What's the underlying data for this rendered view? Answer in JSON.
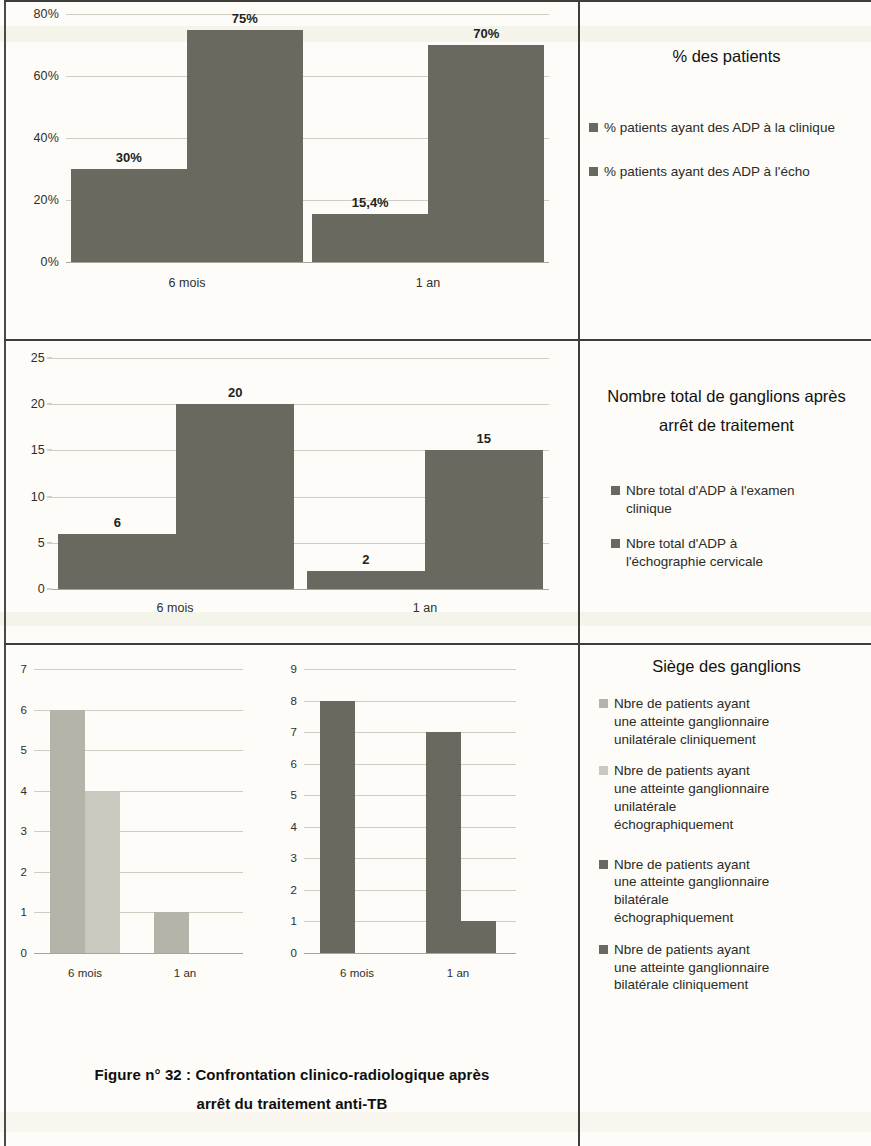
{
  "colors": {
    "bar_dark": "#6a6960",
    "bar_mid": "#a9a89c",
    "bar_light": "#c9c8be",
    "grid": "#cfcdc2",
    "divider": "#3d3d39",
    "text": "#1b1b1b"
  },
  "caption": {
    "text": "Figure n°  32 : Confrontation clinico-radiologique après",
    "text2": "arrêt du traitement anti-TB"
  },
  "panels": [
    {
      "title": "% des patients",
      "legend": [
        {
          "label": "% patients ayant des ADP à la clinique",
          "color": "#6a6960"
        },
        {
          "label": "% patients ayant des ADP à l'écho",
          "color": "#6a6960"
        }
      ]
    },
    {
      "title_line1": "Nombre total de ganglions après",
      "title_line2": "arrêt de traitement",
      "legend": [
        {
          "label": "Nbre total d'ADP à l'examen clinique",
          "color": "#6a6960"
        },
        {
          "label": "Nbre total d'ADP à l'échographie cervicale",
          "color": "#6a6960"
        }
      ]
    },
    {
      "title": "Siège des ganglions",
      "legend": [
        {
          "label": "Nbre de patients ayant une atteinte ganglionnaire unilatérale cliniquement",
          "color": "#b5b4a8"
        },
        {
          "label": "Nbre de patients ayant une atteinte ganglionnaire unilatérale échographiquement",
          "color": "#cac9bf"
        },
        {
          "label": "Nbre de patients ayant une atteinte ganglionnaire bilatérale échographiquement",
          "color": "#6a6960"
        },
        {
          "label": "Nbre de patients ayant une atteinte ganglionnaire bilatérale cliniquement",
          "color": "#6a6960"
        }
      ]
    }
  ],
  "chart_data": [
    {
      "type": "bar",
      "title": "% des patients",
      "categories": [
        "6 mois",
        "1 an"
      ],
      "series": [
        {
          "name": "% patients ayant des ADP à la clinique",
          "values": [
            30,
            15.4
          ],
          "color": "#6a6960"
        },
        {
          "name": "% patients ayant des ADP à l'écho",
          "values": [
            75,
            70
          ],
          "color": "#6a6960"
        }
      ],
      "data_labels": [
        [
          "30%",
          "15,4%"
        ],
        [
          "75%",
          "70%"
        ]
      ],
      "ylim": [
        0,
        80
      ],
      "yticks": [
        0,
        20,
        40,
        60,
        80
      ],
      "ytick_labels": [
        "0%",
        "20%",
        "40%",
        "60%",
        "80%"
      ],
      "xlabel": "",
      "ylabel": "",
      "grid": true,
      "legend_position": "right"
    },
    {
      "type": "bar",
      "title": "Nombre total de ganglions après arrêt de traitement",
      "categories": [
        "6 mois",
        "1 an"
      ],
      "series": [
        {
          "name": "Nbre total d'ADP à l'examen clinique",
          "values": [
            6,
            2
          ],
          "color": "#6a6960"
        },
        {
          "name": "Nbre total d'ADP à l'échographie cervicale",
          "values": [
            20,
            15
          ],
          "color": "#6a6960"
        }
      ],
      "data_labels": [
        [
          "6",
          "2"
        ],
        [
          "20",
          "15"
        ]
      ],
      "ylim": [
        0,
        25
      ],
      "yticks": [
        0,
        5,
        10,
        15,
        20,
        25
      ],
      "ytick_labels": [
        "0",
        "5",
        "10",
        "15",
        "20",
        "25"
      ],
      "xlabel": "",
      "ylabel": "",
      "grid": true,
      "legend_position": "right"
    },
    {
      "type": "bar",
      "title": "Siège des ganglions (unilatérale)",
      "categories": [
        "6 mois",
        "1 an"
      ],
      "series": [
        {
          "name": "Nbre de patients ayant une atteinte ganglionnaire unilatérale cliniquement",
          "values": [
            6,
            1
          ],
          "color": "#b5b4a8"
        },
        {
          "name": "Nbre de patients ayant une atteinte ganglionnaire unilatérale échographiquement",
          "values": [
            4,
            0
          ],
          "color": "#cac9bf"
        }
      ],
      "ylim": [
        0,
        7
      ],
      "yticks": [
        0,
        1,
        2,
        3,
        4,
        5,
        6,
        7
      ],
      "ytick_labels": [
        "0",
        "1",
        "2",
        "3",
        "4",
        "5",
        "6",
        "7"
      ],
      "xlabel": "",
      "ylabel": "",
      "grid": true,
      "legend_position": "right"
    },
    {
      "type": "bar",
      "title": "Siège des ganglions (bilatérale)",
      "categories": [
        "6 mois",
        "1 an"
      ],
      "series": [
        {
          "name": "Nbre de patients ayant une atteinte ganglionnaire bilatérale échographiquement",
          "values": [
            8,
            7
          ],
          "color": "#6a6960"
        },
        {
          "name": "Nbre de patients ayant une atteinte ganglionnaire bilatérale cliniquement",
          "values": [
            0,
            1
          ],
          "color": "#6a6960"
        }
      ],
      "ylim": [
        0,
        9
      ],
      "yticks": [
        0,
        1,
        2,
        3,
        4,
        5,
        6,
        7,
        8,
        9
      ],
      "ytick_labels": [
        "0",
        "1",
        "2",
        "3",
        "4",
        "5",
        "6",
        "7",
        "8",
        "9"
      ],
      "xlabel": "",
      "ylabel": "",
      "grid": true,
      "legend_position": "right"
    }
  ]
}
